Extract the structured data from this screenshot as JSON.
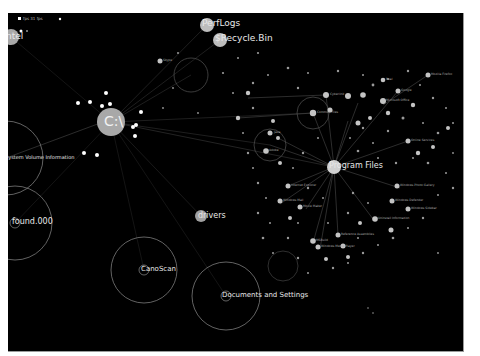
{
  "status": {
    "text": "fps 31 fps"
  },
  "colors": {
    "background": "#000000",
    "node": "#bdbdbd",
    "ring": "#8c8c8c",
    "edge": "#5a5a5a",
    "label": "#e8e8e8"
  },
  "nodes": {
    "root": {
      "label": "C:\\",
      "x": 103,
      "y": 109,
      "r": 14
    },
    "perflogs": {
      "label": "PerfLogs",
      "x": 199,
      "y": 12,
      "r": 7
    },
    "recycle": {
      "label": "$Recycle.Bin",
      "x": 212,
      "y": 27,
      "r": 7
    },
    "program_files": {
      "label": "Program Files",
      "x": 326,
      "y": 154,
      "r": 7
    },
    "drivers": {
      "label": "drivers",
      "x": 193,
      "y": 203,
      "r": 6
    },
    "system_volume": {
      "label": "System Volume Information",
      "x": -2,
      "y": 145,
      "r": 0
    },
    "found": {
      "label": "found.000",
      "x": 7,
      "y": 210,
      "r": 5
    },
    "canoscan": {
      "label": "CanoScan",
      "x": 136,
      "y": 257,
      "r": 5
    },
    "documents": {
      "label": "Documents and Settings",
      "x": 218,
      "y": 283,
      "r": 5
    },
    "partial_left": {
      "label": "ntel",
      "x": 3,
      "y": 24,
      "r": 8
    }
  },
  "rings": [
    {
      "x": -2,
      "y": 145,
      "r": 37
    },
    {
      "x": 7,
      "y": 210,
      "r": 37
    },
    {
      "x": 136,
      "y": 257,
      "r": 33
    },
    {
      "x": 218,
      "y": 283,
      "r": 34
    },
    {
      "x": 183,
      "y": 62,
      "r": 17
    },
    {
      "x": 262,
      "y": 132,
      "r": 16
    },
    {
      "x": 305,
      "y": 100,
      "r": 16
    },
    {
      "x": 275,
      "y": 253,
      "r": 15
    }
  ],
  "cluster_labels": [
    {
      "label": "Cyberlink",
      "x": 318,
      "y": 82
    },
    {
      "label": "Common Files",
      "x": 304,
      "y": 103
    },
    {
      "label": "Google",
      "x": 390,
      "y": 78
    },
    {
      "label": "Mozilla Firefox",
      "x": 430,
      "y": 62
    },
    {
      "label": "Microsoft Office",
      "x": 350,
      "y": 90
    },
    {
      "label": "Internet Explorer",
      "x": 280,
      "y": 173
    },
    {
      "label": "Windows Mail",
      "x": 272,
      "y": 191
    },
    {
      "label": "Movie Maker",
      "x": 298,
      "y": 196
    },
    {
      "label": "Windows Photo Gallery",
      "x": 392,
      "y": 175
    },
    {
      "label": "Windows Defender",
      "x": 385,
      "y": 188
    },
    {
      "label": "MSBuild",
      "x": 305,
      "y": 230
    },
    {
      "label": "Reference Assemblies",
      "x": 330,
      "y": 222
    },
    {
      "label": "Windows Media Player",
      "x": 312,
      "y": 236
    },
    {
      "label": "Online Services",
      "x": 400,
      "y": 128
    },
    {
      "label": "Adobe",
      "x": 258,
      "y": 138
    },
    {
      "label": "Java",
      "x": 270,
      "y": 125
    },
    {
      "label": "Uninstall Information",
      "x": 365,
      "y": 206
    },
    {
      "label": "Windows Sidebar",
      "x": 420,
      "y": 195
    },
    {
      "label": "Real",
      "x": 372,
      "y": 50
    },
    {
      "label": "Skype",
      "x": 152,
      "y": 48
    }
  ]
}
